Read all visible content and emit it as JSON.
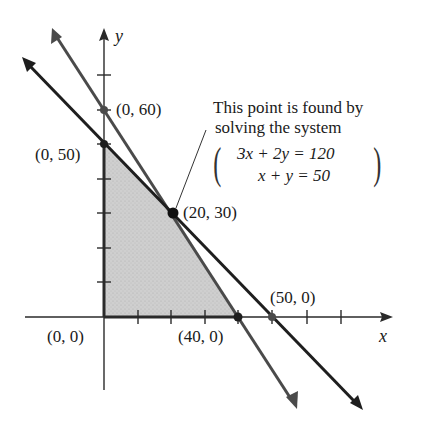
{
  "axes": {
    "x_label": "x",
    "y_label": "y",
    "x_tick_step": 10,
    "y_tick_step": 10
  },
  "points": [
    {
      "label": "(0, 60)",
      "x": 0,
      "y": 60
    },
    {
      "label": "(0, 50)",
      "x": 0,
      "y": 50
    },
    {
      "label": "(20, 30)",
      "x": 20,
      "y": 30
    },
    {
      "label": "(50, 0)",
      "x": 50,
      "y": 0
    },
    {
      "label": "(0, 0)",
      "x": 0,
      "y": 0
    },
    {
      "label": "(40, 0)",
      "x": 40,
      "y": 0
    }
  ],
  "lines": [
    {
      "equation": "3x + 2y = 120",
      "color": "#4a4a4a"
    },
    {
      "equation": "x + y = 50",
      "color": "#1e1e1e"
    }
  ],
  "feasible_region": {
    "vertices": [
      "(0, 0)",
      "(0, 50)",
      "(20, 30)",
      "(40, 0)"
    ],
    "fill": "#c9c9c9"
  },
  "annotation": {
    "line1": "This point is found by",
    "line2": "solving the system",
    "eq1": "3x + 2y = 120",
    "eq2": "x + y = 50"
  }
}
